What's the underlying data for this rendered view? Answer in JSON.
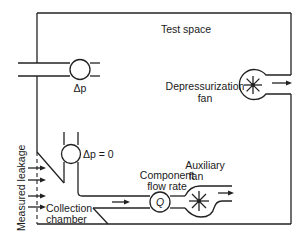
{
  "diagram": {
    "type": "schematic",
    "title": "",
    "labels": {
      "test_space": "Test space",
      "delta_p_top": "Δp",
      "depressurization_fan_line1": "Depressurization",
      "depressurization_fan_line2": "fan",
      "delta_p_zero": "Δp = 0",
      "component_flow_rate_line1": "Component",
      "component_flow_rate_line2": "flow rate",
      "q_symbol": "Q",
      "auxiliary_fan_line1": "Auxiliary",
      "auxiliary_fan_line2": "fan",
      "collection_chamber_line1": "Collection",
      "collection_chamber_line2": "chamber",
      "measured_leakage": "Measured leakage"
    },
    "components": [
      {
        "id": "test-space",
        "kind": "enclosure"
      },
      {
        "id": "pressure-gauge-top",
        "kind": "differential-pressure-meter",
        "label": "Δp"
      },
      {
        "id": "depressurization-fan",
        "kind": "centrifugal-fan"
      },
      {
        "id": "pressure-gauge-zero",
        "kind": "differential-pressure-meter",
        "label": "Δp = 0"
      },
      {
        "id": "flow-meter",
        "kind": "flow-rate-meter",
        "label": "Q"
      },
      {
        "id": "auxiliary-fan",
        "kind": "centrifugal-fan"
      },
      {
        "id": "collection-chamber",
        "kind": "chamber"
      }
    ],
    "colors": {
      "line": "#222222",
      "background": "#ffffff"
    }
  }
}
